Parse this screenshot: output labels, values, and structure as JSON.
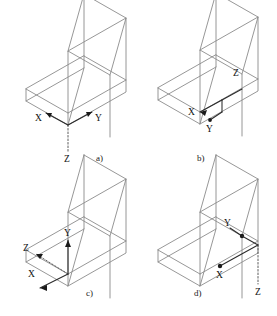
{
  "figure": {
    "type": "isometric-wireframe-technical-drawing",
    "object_shape": "L-shaped block",
    "line_color": "#8b8b8b",
    "axis_color": "#1a1a1a",
    "background": "#ffffff",
    "bottom_caption": ""
  },
  "panels": [
    {
      "id": "a",
      "label": "a)",
      "origin": "front-bottom corner of the lower slab",
      "axes": [
        {
          "name": "X",
          "direction": "up-left",
          "style": "solid",
          "label": "X"
        },
        {
          "name": "Y",
          "direction": "up-right",
          "style": "solid",
          "label": "Y"
        },
        {
          "name": "Z",
          "direction": "down",
          "style": "dashed",
          "label": "Z"
        }
      ]
    },
    {
      "id": "b",
      "label": "b)",
      "origin": "inner concave corner where the vertical wall meets the slab top",
      "axes": [
        {
          "name": "X",
          "direction": "left",
          "style": "solid",
          "label": "X"
        },
        {
          "name": "Y",
          "direction": "down-right",
          "style": "solid",
          "label": "Y"
        },
        {
          "name": "Z",
          "direction": "up-right",
          "style": "solid",
          "label": "Z"
        }
      ]
    },
    {
      "id": "c",
      "label": "c)",
      "origin": "top-left corner of the slab at the base of the vertical wall",
      "axes": [
        {
          "name": "Y",
          "direction": "up",
          "style": "solid",
          "label": "Y"
        },
        {
          "name": "Z",
          "direction": "up-left",
          "style": "dashed",
          "label": "Z"
        },
        {
          "name": "X",
          "direction": "down-left",
          "style": "solid",
          "label": "X"
        }
      ]
    },
    {
      "id": "d",
      "label": "d)",
      "origin": "right-hand corner where the wall meets the slab",
      "axes": [
        {
          "name": "Y",
          "direction": "up-left",
          "style": "solid",
          "label": "Y"
        },
        {
          "name": "X",
          "direction": "down-left",
          "style": "solid",
          "label": "X"
        },
        {
          "name": "Z",
          "direction": "down",
          "style": "dashed",
          "label": "Z"
        }
      ]
    }
  ]
}
